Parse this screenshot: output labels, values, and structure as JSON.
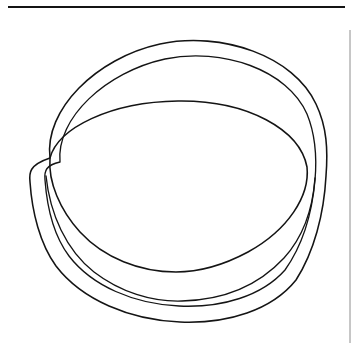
{
  "page": {
    "background_color": "#ffffff",
    "width": 358,
    "height": 343,
    "caption": ""
  },
  "ink": {
    "line_color": "#141414",
    "margin_rule_color": "#8e8e8e"
  },
  "rules": {
    "top_rule": {
      "name": "top-horizontal-rule",
      "x1": 8,
      "y1": 7,
      "x2": 345,
      "y2": 7,
      "thickness": 2.1
    },
    "right_rule": {
      "name": "right-margin-rule",
      "x1": 350,
      "y1": 30,
      "x2": 350,
      "y2": 343,
      "thickness": 1
    }
  },
  "figure": {
    "title": "",
    "outer_rim_outer": {
      "name": "outer-rim-outer-ellipse",
      "cx": 178,
      "cy": 166,
      "rx": 149,
      "ry": 124,
      "rotation": -3
    },
    "outer_rim_inner": {
      "name": "outer-rim-inner-ellipse",
      "cx": 179,
      "cy": 172,
      "rx": 135,
      "ry": 115,
      "rotation": -3
    },
    "bowl_opening": {
      "name": "bowl-opening-ellipse",
      "cx": 179,
      "cy": 187,
      "rx": 128,
      "ry": 86,
      "rotation": -3
    },
    "body_silhouette": {
      "name": "body-outer-silhouette",
      "left_x": 29,
      "right_x": 328,
      "bottom_y": 322
    },
    "body_inner": {
      "name": "body-inner-silhouette",
      "left_x": 42,
      "right_x": 316,
      "bottom_y": 309
    },
    "crossing_points": [
      {
        "name": "left-crossing-point",
        "x": 50,
        "y": 158
      },
      {
        "name": "right-crossing-point",
        "x": 307,
        "y": 167
      }
    ]
  }
}
